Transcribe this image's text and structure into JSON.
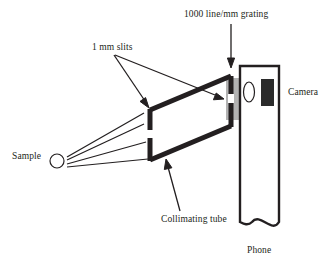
{
  "figure": {
    "type": "schematic-diagram",
    "background_color": "#ffffff",
    "ink_color": "#231f20"
  },
  "labels": {
    "grating": "1000 line/mm grating",
    "slits": "1 mm slits",
    "camera": "Camera",
    "sample": "Sample",
    "collimating_tube": "Collimating tube",
    "phone": "Phone"
  },
  "components": {
    "sample": {
      "name": "Sample",
      "shape": "circle",
      "fill": "#ffffff",
      "stroke": "#231f20",
      "cx": 57,
      "cy": 161,
      "r": 7
    },
    "light_rays": {
      "name": "light rays",
      "count": 4,
      "stroke": "#231f20",
      "origin": [
        66,
        161
      ]
    },
    "collimating_tube": {
      "name": "Collimating tube",
      "shape": "parallelogram",
      "stroke": "#231f20",
      "stroke_width": 5,
      "fill": "#ffffff",
      "slit_count": 2,
      "slit_width_mm": 1
    },
    "grating": {
      "name": "1000 line/mm grating",
      "shape": "rectangle",
      "fill": "#b3b3b3",
      "lines_per_mm": 1000
    },
    "phone": {
      "name": "Phone",
      "shape": "rounded-rectangle-with-break",
      "stroke": "#231f20",
      "stroke_width": 2.4,
      "fill": "#ffffff"
    },
    "camera_lens": {
      "name": "Camera lens",
      "shape": "ellipse",
      "fill": "#ffffff",
      "stroke": "#231f20"
    },
    "camera_sensor": {
      "name": "Camera module",
      "shape": "rectangle",
      "fill": "#2b2b2b"
    }
  },
  "annotations": [
    {
      "label": "1000 line/mm grating",
      "points_to": "grating",
      "arrow": "down"
    },
    {
      "label": "1 mm slits",
      "points_to": "collimating-tube-slits",
      "arrow": "two-branch"
    },
    {
      "label": "Collimating tube",
      "points_to": "collimating-tube",
      "arrow": "up"
    },
    {
      "label": "Camera",
      "points_to": "phone-camera",
      "arrow": "none"
    },
    {
      "label": "Sample",
      "points_to": "sample",
      "arrow": "none"
    },
    {
      "label": "Phone",
      "points_to": "phone",
      "arrow": "none"
    }
  ]
}
